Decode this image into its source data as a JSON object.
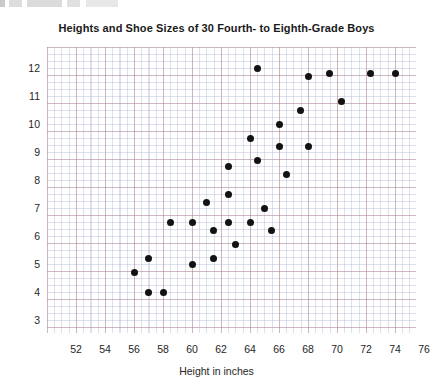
{
  "chart_data": {
    "type": "scatter",
    "title": "Heights and Shoe Sizes of 30 Fourth- to Eighth-Grade Boys",
    "xlabel": "Height in inches",
    "ylabel": "Shoe size",
    "xlim": [
      51,
      77
    ],
    "ylim": [
      2.5,
      12.5
    ],
    "grid": true,
    "legend": "none",
    "xticks": [
      52,
      54,
      56,
      58,
      60,
      62,
      64,
      66,
      68,
      70,
      72,
      74,
      76
    ],
    "yticks": [
      3,
      4,
      5,
      6,
      7,
      8,
      9,
      10,
      11,
      12
    ],
    "point_count": 30,
    "series": [
      {
        "name": "Boys",
        "marker": "filled-circle",
        "color": "#121212",
        "points": [
          {
            "x": 56.0,
            "y": 4.7
          },
          {
            "x": 57.0,
            "y": 5.2
          },
          {
            "x": 57.0,
            "y": 4.0
          },
          {
            "x": 58.0,
            "y": 4.0
          },
          {
            "x": 58.5,
            "y": 6.5
          },
          {
            "x": 60.0,
            "y": 6.5
          },
          {
            "x": 60.0,
            "y": 5.0
          },
          {
            "x": 61.0,
            "y": 7.2
          },
          {
            "x": 61.5,
            "y": 6.2
          },
          {
            "x": 61.5,
            "y": 5.2
          },
          {
            "x": 62.5,
            "y": 8.5
          },
          {
            "x": 62.5,
            "y": 7.5
          },
          {
            "x": 62.5,
            "y": 6.5
          },
          {
            "x": 63.0,
            "y": 5.7
          },
          {
            "x": 64.0,
            "y": 9.5
          },
          {
            "x": 64.0,
            "y": 6.5
          },
          {
            "x": 64.5,
            "y": 12.0
          },
          {
            "x": 64.5,
            "y": 8.7
          },
          {
            "x": 65.0,
            "y": 7.0
          },
          {
            "x": 65.5,
            "y": 6.2
          },
          {
            "x": 66.0,
            "y": 10.0
          },
          {
            "x": 66.0,
            "y": 9.2
          },
          {
            "x": 66.5,
            "y": 8.2
          },
          {
            "x": 67.5,
            "y": 10.5
          },
          {
            "x": 68.0,
            "y": 11.7
          },
          {
            "x": 68.0,
            "y": 9.2
          },
          {
            "x": 69.5,
            "y": 11.8
          },
          {
            "x": 70.3,
            "y": 10.8
          },
          {
            "x": 72.3,
            "y": 11.8
          },
          {
            "x": 74.0,
            "y": 11.8
          }
        ]
      }
    ]
  },
  "colors": {
    "marker": "#121212",
    "grid_major": "#c47869",
    "grid_minor": "#969bc8",
    "text": "#262626"
  }
}
